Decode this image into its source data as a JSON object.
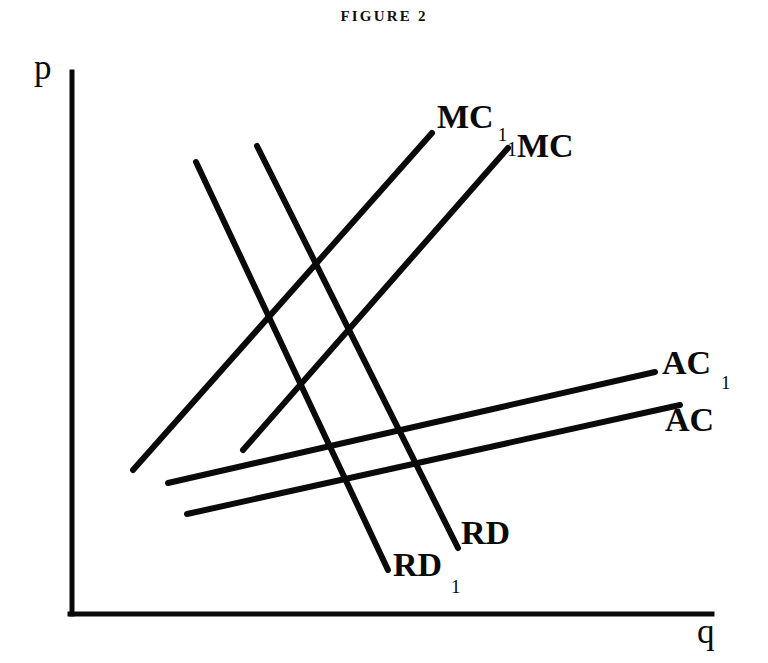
{
  "figure": {
    "title": "FIGURE 2",
    "axes": {
      "y_label": "p",
      "x_label": "q",
      "origin": [
        72,
        614
      ],
      "y_axis_top": [
        72,
        72
      ],
      "x_axis_right": [
        712,
        614
      ],
      "color": "#0a0a0a"
    },
    "labels": {
      "mc1_main": "MC",
      "mc1_sub": "1",
      "mc_main": "MC",
      "mc_sub": "1",
      "ac1_main": "AC",
      "ac1_sub": "1",
      "ac_main": "AC",
      "rd_main": "RD",
      "rd1_main": "RD",
      "rd1_sub": "1"
    }
  },
  "chart_data": {
    "type": "line",
    "title": "FIGURE 2",
    "xlabel": "q",
    "ylabel": "p",
    "grid": false,
    "legend": "inline-endpoint-labels",
    "axis_pixel_frame": {
      "origin": [
        72,
        614
      ],
      "x_axis_end": [
        712,
        614
      ],
      "y_axis_end": [
        72,
        72
      ]
    },
    "note": "Schematic economics diagram: two upward-sloping marginal cost curves (MC, MC1), two gently upward-sloping average cost curves (AC, AC1), and two steeply downward-sloping residual demand curves (RD, RD1). No numeric tick labels are printed on either axis.",
    "series": [
      {
        "name": "MC1",
        "label": "MC",
        "subscript": "1",
        "slope": "steep-upward",
        "points": [
          [
            133,
            470
          ],
          [
            432,
            133
          ]
        ],
        "label_anchor": [
          437,
          100
        ]
      },
      {
        "name": "MC",
        "label": "MC",
        "subscript": "1",
        "slope": "steep-upward",
        "points": [
          [
            243,
            450
          ],
          [
            508,
            148
          ]
        ],
        "label_anchor": [
          507,
          129
        ]
      },
      {
        "name": "AC1",
        "label": "AC",
        "subscript": "1",
        "slope": "shallow-upward",
        "points": [
          [
            168,
            483
          ],
          [
            655,
            372
          ]
        ],
        "label_anchor": [
          662,
          346
        ]
      },
      {
        "name": "AC",
        "label": "AC",
        "subscript": "",
        "slope": "shallow-upward",
        "points": [
          [
            187,
            514
          ],
          [
            680,
            405
          ]
        ],
        "label_anchor": [
          665,
          403
        ]
      },
      {
        "name": "RD",
        "label": "RD",
        "subscript": "",
        "slope": "steep-downward",
        "points": [
          [
            257,
            146
          ],
          [
            458,
            548
          ]
        ],
        "label_anchor": [
          461,
          516
        ]
      },
      {
        "name": "RD1",
        "label": "RD",
        "subscript": "1",
        "slope": "steep-downward",
        "points": [
          [
            196,
            162
          ],
          [
            388,
            570
          ]
        ],
        "label_anchor": [
          393,
          548
        ]
      }
    ]
  }
}
